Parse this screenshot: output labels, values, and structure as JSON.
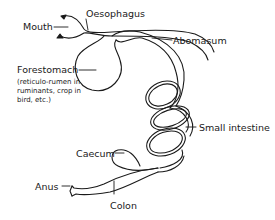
{
  "diagram": {
    "type": "digestive-tract-schematic",
    "labels": {
      "mouth": "Mouth",
      "oesophagus": "Oesophagus",
      "abomasum": "Abomasum",
      "forestomach": "Forestomach",
      "forestomach_note": "(reticulo-rumen in\nruminants, crop in\nbird, etc.)",
      "small_intestine": "Small intestine",
      "caecum": "Caecum",
      "anus": "Anus",
      "colon": "Colon"
    },
    "colors": {
      "line": "#1a1a1a",
      "background": "#ffffff"
    }
  }
}
